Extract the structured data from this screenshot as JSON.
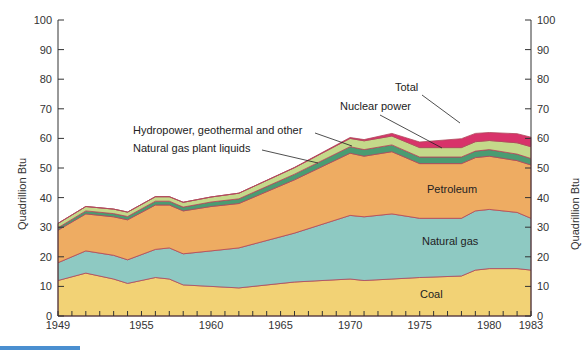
{
  "chart_data": {
    "type": "area",
    "title": "",
    "xlabel": "",
    "ylabel": "Quadrillion Btu",
    "ylabel_right": "Quadrillion Btu",
    "ylim": [
      0,
      100
    ],
    "xlim": [
      1949,
      1983
    ],
    "x_ticks": [
      "1949",
      "1955",
      "1960",
      "1965",
      "1970",
      "1975",
      "1980",
      "1983"
    ],
    "y_ticks": [
      0,
      10,
      20,
      30,
      40,
      50,
      60,
      70,
      80,
      90,
      100
    ],
    "stacked": true,
    "x": [
      1949,
      1951,
      1953,
      1954,
      1956,
      1957,
      1958,
      1960,
      1962,
      1966,
      1970,
      1971,
      1973,
      1975,
      1978,
      1979,
      1980,
      1982,
      1983
    ],
    "series": [
      {
        "name": "Coal",
        "color": "#f2d275",
        "values": [
          12,
          14.5,
          12.5,
          11,
          13,
          12.5,
          10.5,
          10,
          9.5,
          11.5,
          12.5,
          12,
          12.5,
          13,
          13.5,
          15.5,
          16,
          16,
          15.5
        ]
      },
      {
        "name": "Natural gas",
        "color": "#8ec9c2",
        "values": [
          6,
          7.5,
          8,
          8,
          9.5,
          10.5,
          10.5,
          12,
          13.5,
          16.5,
          21.5,
          21.5,
          22,
          20,
          19.5,
          20,
          20,
          19,
          17.5
        ]
      },
      {
        "name": "Petroleum",
        "color": "#eeac62",
        "values": [
          11,
          12.5,
          13,
          13.5,
          15,
          14.5,
          14.5,
          15,
          15,
          18,
          21,
          20.5,
          21,
          18.5,
          18.5,
          18,
          18,
          17.5,
          18
        ]
      },
      {
        "name": "Natural gas plant liquids",
        "color": "#4a9c72",
        "values": [
          0.8,
          1,
          1.1,
          1.1,
          1.3,
          1.3,
          1.3,
          1.5,
          1.6,
          1.9,
          2.2,
          2.2,
          2.3,
          2.2,
          2.2,
          2.2,
          2.2,
          2.2,
          2.2
        ]
      },
      {
        "name": "Hydropower, geothermal and other",
        "color": "#c4d98a",
        "values": [
          1.5,
          1.5,
          1.5,
          1.5,
          1.5,
          1.5,
          1.6,
          1.7,
          1.9,
          2.2,
          2.8,
          3,
          3,
          3.2,
          3.2,
          3.2,
          3.1,
          3.8,
          4
        ]
      },
      {
        "name": "Nuclear power",
        "color": "#d8336a",
        "values": [
          0,
          0,
          0,
          0,
          0,
          0,
          0,
          0,
          0,
          0.1,
          0.3,
          0.4,
          0.9,
          1.9,
          3,
          2.8,
          2.7,
          3.1,
          3.2
        ]
      }
    ],
    "total": [
      31.3,
      37,
      36.1,
      35.1,
      40.3,
      40.3,
      38.4,
      40.2,
      41.5,
      50.2,
      60.3,
      59.6,
      61.7,
      58.8,
      59.9,
      61.7,
      62,
      61.6,
      60.4
    ],
    "annotations": [
      {
        "text": "Total",
        "arrow_to": "total-band-1981"
      },
      {
        "text": "Nuclear power",
        "arrow_to": "nuclear-band-1975"
      },
      {
        "text": "Hydropower, geothermal  and other",
        "arrow_to": "hydro-band-1970"
      },
      {
        "text": "Natural gas plant liquids",
        "arrow_to": "ngpl-band-1968"
      },
      {
        "text": "Petroleum",
        "inline": true
      },
      {
        "text": "Natural gas",
        "inline": true
      },
      {
        "text": "Coal",
        "inline": true
      }
    ],
    "grid": false,
    "legend": "inline-labels"
  },
  "labels": {
    "ylabel_left": "Quadrillion Btu",
    "ylabel_right": "Quadrillion Btu",
    "total": "Total",
    "nuclear": "Nuclear power",
    "hydro": "Hydropower, geothermal  and other",
    "ngpl": "Natural gas plant liquids",
    "petroleum": "Petroleum",
    "natural_gas": "Natural gas",
    "coal": "Coal"
  }
}
